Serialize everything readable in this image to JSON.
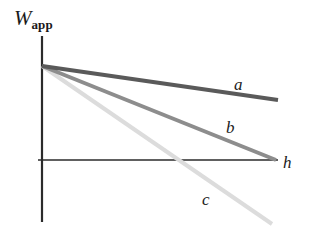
{
  "chart_data": {
    "type": "line",
    "title": "",
    "xlabel": "h",
    "ylabel": "W_app",
    "grid": false,
    "legend_position": "inline-end-of-line",
    "axes": {
      "x_axis": {
        "label": "h",
        "from": [
          42,
          160
        ],
        "to": [
          278,
          160
        ]
      },
      "y_axis": {
        "label": "W_app",
        "from": [
          42,
          36
        ],
        "to": [
          42,
          222
        ]
      },
      "origin": [
        42,
        160
      ]
    },
    "series": [
      {
        "name": "a",
        "label": "a",
        "color": "#5a5a5a",
        "width": 4,
        "start": [
          42,
          66
        ],
        "end": [
          278,
          100
        ],
        "slope_sign": "negative",
        "slope_magnitude": "shallow",
        "crosses_zero": false
      },
      {
        "name": "b",
        "label": "b",
        "color": "#8d8d8d",
        "width": 4,
        "start": [
          42,
          66
        ],
        "end": [
          276,
          160
        ],
        "slope_sign": "negative",
        "slope_magnitude": "medium",
        "crosses_zero": true,
        "zero_crossing_h": "at right end of axis"
      },
      {
        "name": "c",
        "label": "c",
        "color": "#dcdcdc",
        "width": 4,
        "start": [
          42,
          66
        ],
        "end": [
          272,
          224
        ],
        "slope_sign": "negative",
        "slope_magnitude": "steep",
        "crosses_zero": true,
        "zero_crossing_h": "about 60 percent across axis"
      }
    ],
    "ylabel_parts": {
      "base": "W",
      "subscript": "app"
    }
  },
  "figure": {
    "y_axis_label_base": "W",
    "y_axis_label_sub": "app",
    "x_axis_label": "h",
    "curve_label_a": "a",
    "curve_label_b": "b",
    "curve_label_c": "c"
  },
  "colors": {
    "axis": "#2b2b2b",
    "line_a": "#5a5a5a",
    "line_b": "#8d8d8d",
    "line_c": "#dcdcdc",
    "text": "#1a1a1a",
    "background": "#ffffff"
  }
}
